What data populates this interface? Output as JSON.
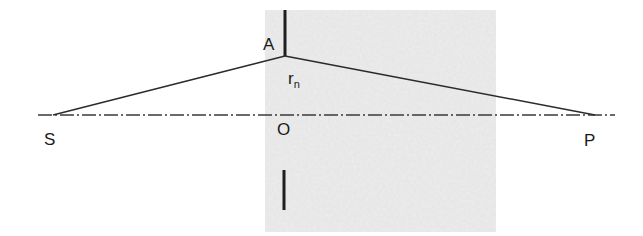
{
  "diagram": {
    "type": "fresnel-zone-geometry",
    "labels": {
      "A": "A",
      "r": "r",
      "r_sub": "n",
      "S": "S",
      "O": "O",
      "P": "P"
    },
    "colors": {
      "line": "#2a2a2a",
      "axis": "#3a3a3a",
      "shaded_region": "#ececec",
      "background": "#ffffff"
    },
    "points": {
      "S": [
        53,
        115
      ],
      "A": [
        285,
        56
      ],
      "O": [
        285,
        115
      ],
      "P": [
        595,
        115
      ]
    }
  }
}
